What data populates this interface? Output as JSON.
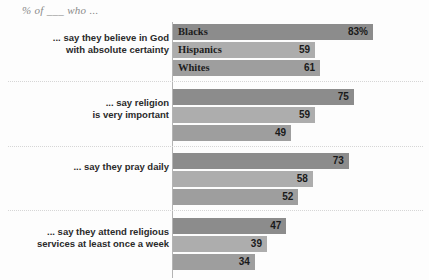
{
  "chart_data": {
    "type": "bar",
    "orientation": "horizontal",
    "title": "% of ___ who ...",
    "xlabel": "",
    "ylabel": "",
    "xlim": [
      0,
      100
    ],
    "grid": false,
    "legend_position": "in-bar-first-group",
    "series": [
      {
        "name": "Blacks",
        "color": "#8c8c8c",
        "values": [
          83,
          75,
          73,
          47
        ],
        "value_labels": [
          "83%",
          "75",
          "73",
          "47"
        ]
      },
      {
        "name": "Hispanics",
        "color": "#adadad",
        "values": [
          59,
          59,
          58,
          39
        ],
        "value_labels": [
          "59",
          "59",
          "58",
          "39"
        ]
      },
      {
        "name": "Whites",
        "color": "#9e9e9e",
        "values": [
          61,
          49,
          52,
          34
        ],
        "value_labels": [
          "61",
          "49",
          "52",
          "34"
        ]
      }
    ],
    "categories": [
      "... say they believe in God with absolute certainty",
      "... say religion is very important",
      "... say they pray daily",
      "... say they attend religious services at least once a week"
    ]
  },
  "groups": [
    {
      "label_line1": "... say they believe in God",
      "label_line2": "with absolute certainty",
      "show_series_labels": true,
      "rows": [
        {
          "series": "Blacks",
          "value": 83,
          "value_label": "83%",
          "color": "#8c8c8c"
        },
        {
          "series": "Hispanics",
          "value": 59,
          "value_label": "59",
          "color": "#adadad"
        },
        {
          "series": "Whites",
          "value": 61,
          "value_label": "61",
          "color": "#9e9e9e"
        }
      ]
    },
    {
      "label_line1": "... say religion",
      "label_line2": "is very important",
      "show_series_labels": false,
      "rows": [
        {
          "series": "Blacks",
          "value": 75,
          "value_label": "75",
          "color": "#8c8c8c"
        },
        {
          "series": "Hispanics",
          "value": 59,
          "value_label": "59",
          "color": "#adadad"
        },
        {
          "series": "Whites",
          "value": 49,
          "value_label": "49",
          "color": "#9e9e9e"
        }
      ]
    },
    {
      "label_line1": "... say they pray daily",
      "label_line2": "",
      "show_series_labels": false,
      "rows": [
        {
          "series": "Blacks",
          "value": 73,
          "value_label": "73",
          "color": "#8c8c8c"
        },
        {
          "series": "Hispanics",
          "value": 58,
          "value_label": "58",
          "color": "#adadad"
        },
        {
          "series": "Whites",
          "value": 52,
          "value_label": "52",
          "color": "#9e9e9e"
        }
      ]
    },
    {
      "label_line1": "... say they attend religious",
      "label_line2": "services at least once a week",
      "show_series_labels": false,
      "rows": [
        {
          "series": "Blacks",
          "value": 47,
          "value_label": "47",
          "color": "#8c8c8c"
        },
        {
          "series": "Hispanics",
          "value": 39,
          "value_label": "39",
          "color": "#adadad"
        },
        {
          "series": "Whites",
          "value": 34,
          "value_label": "34",
          "color": "#9e9e9e"
        }
      ]
    }
  ],
  "style": {
    "background": "#fdfdfd",
    "axis_color": "#b4b4b4",
    "divider_color": "#d6d6d6",
    "title_color": "#8a8a8a"
  }
}
